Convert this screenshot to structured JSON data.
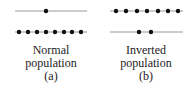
{
  "colors": {
    "line": "#9a9a9a",
    "dot": "#111111",
    "text": "#222222"
  },
  "panels": [
    {
      "id": "a",
      "title_line1": "Normal",
      "title_line2": "population",
      "tag": "(a)",
      "upper_level": {
        "x1": 15,
        "x2": 87,
        "y": 11,
        "dots": [
          46
        ]
      },
      "lower_level": {
        "x1": 15,
        "x2": 87,
        "y": 32,
        "dots": [
          19,
          28,
          37,
          46,
          55,
          64,
          72,
          81
        ]
      }
    },
    {
      "id": "b",
      "title_line1": "Inverted",
      "title_line2": "population",
      "tag": "(b)",
      "upper_level": {
        "x1": 110,
        "x2": 183,
        "y": 11,
        "dots": [
          116,
          126,
          137,
          147,
          158,
          168,
          178
        ]
      },
      "lower_level": {
        "x1": 110,
        "x2": 183,
        "y": 32,
        "dots": [
          139,
          151
        ]
      }
    }
  ]
}
